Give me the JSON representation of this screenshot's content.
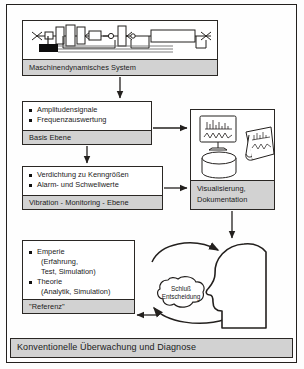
{
  "figure": {
    "caption": "Konventionelle Überwachung und Diagnose"
  },
  "blocks": {
    "machine": {
      "footer_label": "Maschinendynamisches System",
      "diagram_icon": "machine-rotor-schematic"
    },
    "basis": {
      "items": [
        "Amplitudensignale",
        "Frequenzauswertung"
      ],
      "footer_label": "Basis Ebene"
    },
    "vibration": {
      "items": [
        "Verdichtung zu Kenngrößen",
        "Alarm- und Schwellwerte"
      ],
      "footer_label": "Vibration - Monitoring - Ebene"
    },
    "referenz": {
      "items": [
        {
          "bullet": "Emperie",
          "subs": [
            "(Erfahrung,",
            "Test, Simulation)"
          ]
        },
        {
          "bullet": "Theorie",
          "subs": [
            "(Analytik, Simulation)"
          ]
        }
      ],
      "footer_label": "\"Referenz\""
    },
    "visual": {
      "footer_line1": "Visualisierung,",
      "footer_line2": "Dokumentation",
      "icons": [
        "monitor-chart-icon",
        "paper-chart-roll-icon",
        "database-cylinder-icon"
      ]
    }
  },
  "decision": {
    "cloud_line1": "Schluß",
    "cloud_line2": "Entscheidung",
    "head_icon": "human-head-profile-icon",
    "loop_icon": "feedback-loop-arrows"
  },
  "colors": {
    "footer_gray": "#d2d2d2",
    "line_black": "#2a2724",
    "page_white": "#ffffff"
  }
}
